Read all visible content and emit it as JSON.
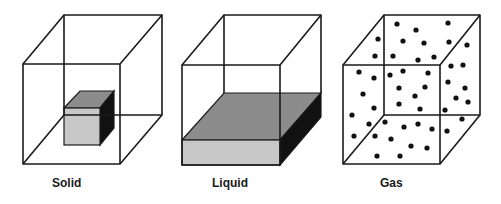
{
  "diagram": {
    "panels": [
      {
        "id": "solid",
        "label": "Solid",
        "label_x": 52
      },
      {
        "id": "liquid",
        "label": "Liquid",
        "label_x": 212
      },
      {
        "id": "gas",
        "label": "Gas",
        "label_x": 380
      }
    ],
    "colors": {
      "edge": "#1a1a1a",
      "front_face": "#c8c8c8",
      "top_face": "#8c8c8c",
      "side_face": "#111111",
      "particle": "#111111"
    },
    "gas_particles": [
      [
        397,
        24
      ],
      [
        448,
        23
      ],
      [
        416,
        30
      ],
      [
        378,
        39
      ],
      [
        403,
        41
      ],
      [
        424,
        43
      ],
      [
        449,
        42
      ],
      [
        467,
        45
      ],
      [
        375,
        56
      ],
      [
        393,
        56
      ],
      [
        418,
        60
      ],
      [
        434,
        57
      ],
      [
        451,
        66
      ],
      [
        463,
        65
      ],
      [
        359,
        72
      ],
      [
        374,
        78
      ],
      [
        390,
        75
      ],
      [
        403,
        71
      ],
      [
        428,
        73
      ],
      [
        448,
        82
      ],
      [
        465,
        88
      ],
      [
        363,
        94
      ],
      [
        399,
        88
      ],
      [
        425,
        87
      ],
      [
        415,
        96
      ],
      [
        456,
        98
      ],
      [
        468,
        102
      ],
      [
        374,
        108
      ],
      [
        399,
        104
      ],
      [
        420,
        109
      ],
      [
        445,
        110
      ],
      [
        352,
        115
      ],
      [
        369,
        124
      ],
      [
        385,
        122
      ],
      [
        404,
        127
      ],
      [
        418,
        124
      ],
      [
        432,
        129
      ],
      [
        462,
        119
      ],
      [
        447,
        131
      ],
      [
        354,
        136
      ],
      [
        375,
        136
      ],
      [
        391,
        139
      ],
      [
        411,
        146
      ],
      [
        427,
        148
      ],
      [
        377,
        156
      ],
      [
        400,
        156
      ]
    ]
  }
}
